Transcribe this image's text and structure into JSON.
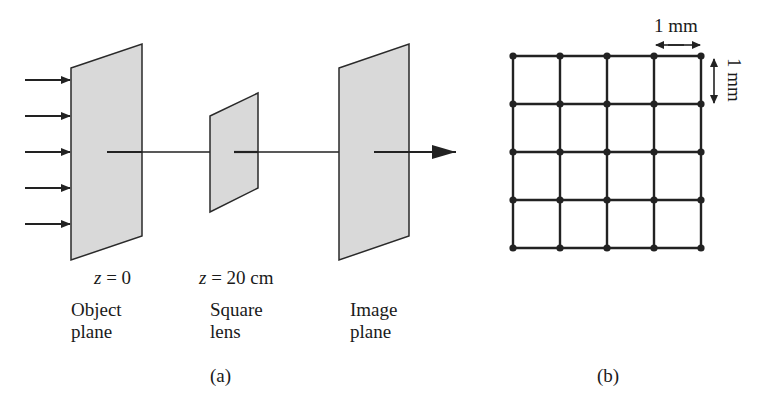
{
  "panel_a": {
    "caption": "(a)",
    "object_plane": {
      "z_label_var": "z",
      "z_label_value": " = 0",
      "name_line1": "Object",
      "name_line2": "plane"
    },
    "square_lens": {
      "z_label_var": "z",
      "z_label_value": " = 20 cm",
      "name_line1": "Square",
      "name_line2": "lens"
    },
    "image_plane": {
      "name_line1": "Image",
      "name_line2": "plane"
    },
    "incident_arrows": 5,
    "colors": {
      "plane_fill": "#d9d9d9",
      "stroke": "#2a2a2a"
    }
  },
  "panel_b": {
    "caption": "(b)",
    "grid": {
      "rows": 5,
      "cols": 5,
      "cells": "4x4"
    },
    "horizontal_scale_label": "1 mm",
    "vertical_scale_label": "1 mm"
  }
}
